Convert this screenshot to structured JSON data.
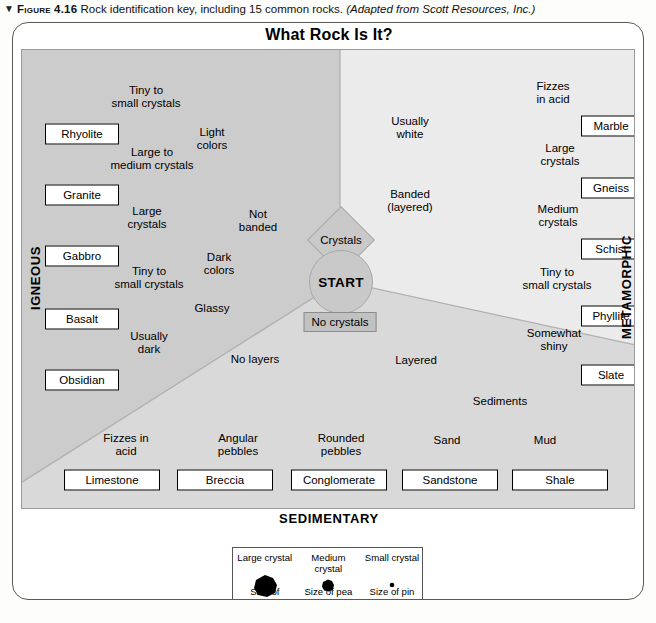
{
  "caption": {
    "marker": "▼",
    "figure_number": "Figure 4.16",
    "text": "Rock identification key, including 15 common rocks.",
    "source": "(Adapted from Scott Resources, Inc.)"
  },
  "title": "What Rock Is It?",
  "start_node": "START",
  "decision_nodes": {
    "crystals": "Crystals",
    "no_crystals": "No crystals"
  },
  "category_labels": {
    "igneous": "IGNEOUS",
    "metamorphic": "METAMORPHIC",
    "sedimentary": "SEDIMENTARY"
  },
  "igneous_branch": {
    "not_banded": "Not\nbanded",
    "light_colors": "Light\ncolors",
    "dark_colors": "Dark\ncolors",
    "steps": [
      {
        "label": "Tiny to\nsmall crystals",
        "rock": "Rhyolite"
      },
      {
        "label": "Large to\nmedium crystals",
        "rock": "Granite"
      },
      {
        "label": "Large\ncrystals",
        "rock": "Gabbro"
      },
      {
        "label": "Tiny to\nsmall crystals",
        "rock": "Basalt"
      },
      {
        "label": "Usually\ndark",
        "rock": "Obsidian"
      }
    ],
    "glassy": "Glassy"
  },
  "metamorphic_branch": {
    "usually_white": "Usually\nwhite",
    "banded": "Banded\n(layered)",
    "steps": [
      {
        "label": "Fizzes\nin acid",
        "rock": "Marble"
      },
      {
        "label": "Large\ncrystals",
        "rock": "Gneiss"
      },
      {
        "label": "Medium\ncrystals",
        "rock": "Schist"
      },
      {
        "label": "Tiny to\nsmall crystals",
        "rock": "Phyllite"
      },
      {
        "label": "Somewhat\nshiny",
        "rock": "Slate"
      }
    ]
  },
  "sedimentary_branch": {
    "no_layers": "No layers",
    "layered": "Layered",
    "sediments": "Sediments",
    "tests": [
      "Fizzes in\nacid",
      "Angular\npebbles",
      "Rounded\npebbles",
      "Sand",
      "Mud"
    ],
    "rocks": [
      "Limestone",
      "Breccia",
      "Conglomerate",
      "Sandstone",
      "Shale"
    ]
  },
  "legend": {
    "columns": [
      {
        "heading": "Large crystal",
        "footer": "Size of\nfingernail",
        "size": 22
      },
      {
        "heading": "Medium crystal",
        "footer": "Size of\npea",
        "size": 11
      },
      {
        "heading": "Small crystal",
        "footer": "Size of\npin head",
        "size": 4
      }
    ]
  },
  "colors": {
    "igneous_zone": "#cccccc",
    "sedimentary_zone": "#d9d9d9",
    "metamorphic_zone": "#ebebeb",
    "node_fill": "#c9c9c9",
    "frame": "#5a5a5a",
    "arrow": "#111111"
  }
}
